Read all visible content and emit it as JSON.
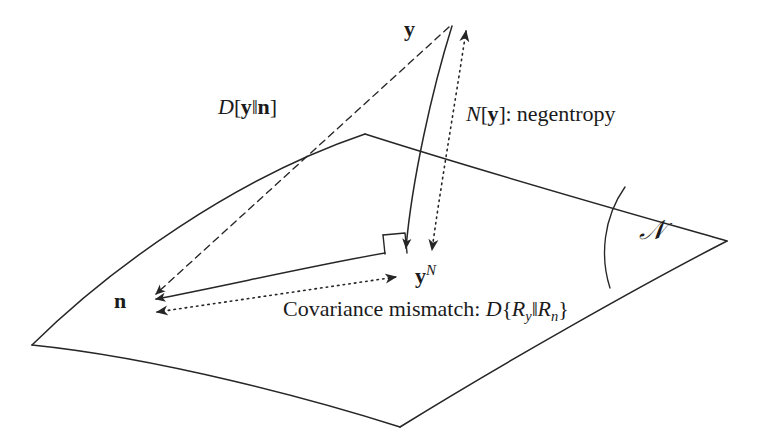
{
  "figure": {
    "background_color": "#ffffff",
    "stroke_color": "#262626",
    "text_color": "#1b1b1b",
    "width": 761,
    "height": 446
  },
  "labels": {
    "y_vector": "y",
    "n_vector": "n",
    "yn_vector": {
      "base": "y",
      "superscript": "N"
    },
    "divergence": {
      "operator": "D",
      "open": "[",
      "arg1": "y",
      "sep": "‖",
      "arg2": "n",
      "close": "]"
    },
    "negentropy": {
      "operator": "N",
      "open": "[",
      "arg": "y",
      "close": "]",
      "colon": ":",
      "description": "negentropy"
    },
    "covariance": {
      "description": "Covariance mismatch:",
      "operator": "D",
      "open": "{",
      "arg1_base": "R",
      "arg1_sub": "y",
      "sep": "‖",
      "arg2_base": "R",
      "arg2_sub": "n",
      "close": "}"
    },
    "manifold": "𝒩"
  },
  "geometry": {
    "manifold_corners": {
      "left": [
        32,
        345
      ],
      "top_apex": [
        365,
        134
      ],
      "right": [
        727,
        241
      ],
      "bottom": [
        400,
        427
      ]
    },
    "y_apex": [
      452,
      24
    ],
    "n_point": [
      148,
      301
    ],
    "yn_point": [
      407,
      253
    ],
    "right_angle_marker": [
      383,
      233,
      407,
      253
    ],
    "negentropy_arrow": [
      [
        466,
        29
      ],
      [
        431,
        255
      ]
    ],
    "covariance_arrow": [
      [
        150,
        313
      ],
      [
        400,
        276
      ]
    ],
    "manifold_arc": [
      [
        625,
        187
      ],
      [
        610,
        288
      ]
    ]
  },
  "line_styles": {
    "manifold_boundary": "solid",
    "divergence_line": "dashed",
    "negentropy_line": "dotted",
    "covariance_line": "dotted",
    "projection_line": "solid"
  }
}
